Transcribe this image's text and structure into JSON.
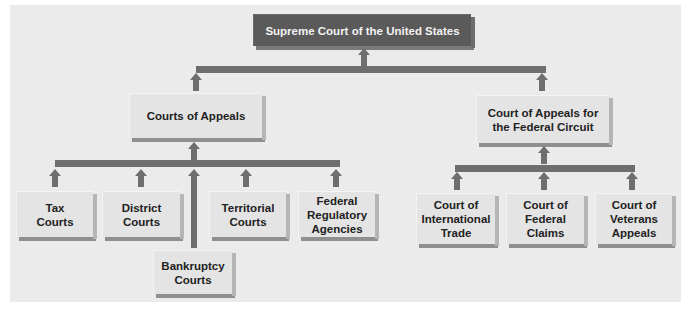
{
  "diagram": {
    "top": {
      "label": "Supreme Court of the United States"
    },
    "level2": [
      {
        "label": "Courts of Appeals"
      },
      {
        "label": "Court of Appeals for the Federal Circuit"
      }
    ],
    "appeals_children": [
      {
        "label": "Tax Courts"
      },
      {
        "label": "District Courts"
      },
      {
        "label": "Bankruptcy Courts"
      },
      {
        "label": "Territorial Courts"
      },
      {
        "label": "Federal Regulatory Agencies"
      }
    ],
    "federal_circuit_children": [
      {
        "label": "Court of International Trade"
      },
      {
        "label": "Court of Federal Claims"
      },
      {
        "label": "Court of Veterans Appeals"
      }
    ],
    "colors": {
      "panel": "#ebebeb",
      "box": "#e4e4e4",
      "top_box": "#5a5a5a",
      "connector": "#6e6e6e"
    }
  }
}
